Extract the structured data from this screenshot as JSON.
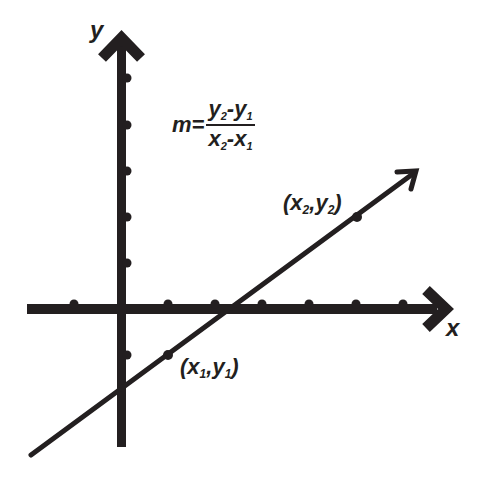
{
  "diagram": {
    "axes": {
      "x_label": "x",
      "y_label": "y",
      "color": "#231f20",
      "origin_px": [
        121,
        309
      ],
      "tick_spacing_px": 47,
      "x_ticks_count_left": 1,
      "x_ticks_count_right": 6,
      "y_ticks_count_up": 5,
      "y_ticks_count_down": 1
    },
    "formula": {
      "lhs": "m=",
      "numerator": {
        "a": "y",
        "a_sub": "2",
        "op": "-",
        "b": "y",
        "b_sub": "1"
      },
      "denominator": {
        "a": "x",
        "a_sub": "2",
        "op": "-",
        "b": "x",
        "b_sub": "1"
      }
    },
    "points": [
      {
        "name": "point-1",
        "label_open": "(",
        "var1": "x",
        "sub1": "1",
        "sep": ",",
        "var2": "y",
        "sub2": "1",
        "label_close": ")",
        "grid": [
          1,
          -1
        ]
      },
      {
        "name": "point-2",
        "label_open": "(",
        "var1": "x",
        "sub1": "2",
        "sep": ",",
        "var2": "y",
        "sub2": "2",
        "label_close": ")",
        "grid": [
          5,
          2
        ]
      }
    ],
    "line": {
      "description": "Straight line with arrowhead passing through (x1,y1) and (x2,y2)",
      "direction": "up-right"
    }
  }
}
